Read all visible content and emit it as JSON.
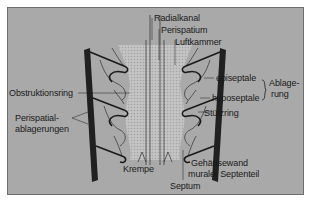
{
  "diagram": {
    "labels": {
      "radialkanal": "Radialkanal",
      "perispatium": "Perispatium",
      "luftkammer": "Luftkammer",
      "episeptale": "episeptale",
      "hyposeptale": "hyposeptale",
      "ablagerung_1": "Ablage-",
      "ablagerung_2": "rung",
      "stuetzring": "Stützring",
      "obstruktionsring": "Obstruktionsring",
      "perispatial_1": "Perispatial-",
      "perispatial_2": "ablagerungen",
      "krempe": "Krempe",
      "gehaeusewand": "Gehäusewand",
      "muraler_septenteil": "muraler Septenteil",
      "septum": "Septum"
    },
    "colors": {
      "background": "#a9a9a9",
      "ink": "#1a1a1a",
      "wall": "#202020",
      "stipple": "#cfcfcf"
    }
  }
}
